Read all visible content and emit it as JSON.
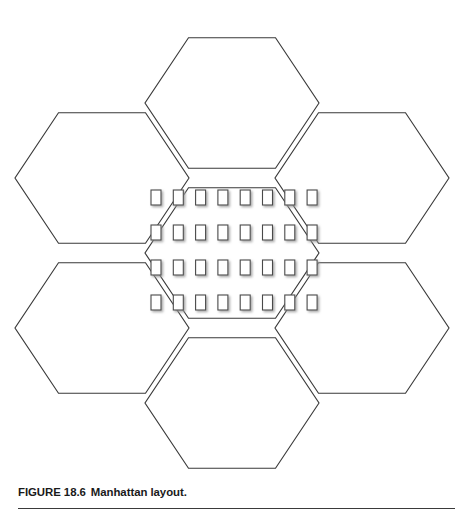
{
  "figure": {
    "caption_label": "FIGURE 18.6",
    "caption_text": "Manhattan layout.",
    "caption_full": "FIGURE 18.6  Manhattan layout.",
    "background_color": "#ffffff",
    "line_color": "#3a3a3a",
    "building_fill": "#ffffff",
    "building_stroke": "#4a4a4a",
    "building_shadow": "#bfbfbf",
    "rule_color": "#3a3a3a"
  },
  "diagram": {
    "type": "cellular-honeycomb-layout",
    "hex_cell_count": 7,
    "hex_radius": 87,
    "hex_centers": [
      {
        "name": "center-cell",
        "cx": 232,
        "cy": 253
      },
      {
        "name": "top-cell",
        "cx": 232,
        "cy": 103
      },
      {
        "name": "bottom-cell",
        "cx": 232,
        "cy": 403
      },
      {
        "name": "upper-left-cell",
        "cx": 102,
        "cy": 178
      },
      {
        "name": "upper-right-cell",
        "cx": 362,
        "cy": 178
      },
      {
        "name": "lower-left-cell",
        "cx": 102,
        "cy": 328
      },
      {
        "name": "lower-right-cell",
        "cx": 362,
        "cy": 328
      }
    ],
    "building_grid": {
      "rows": 4,
      "cols": 8,
      "building_width": 10,
      "building_height": 15,
      "col_step": 22.3,
      "row_step": 35,
      "origin_x": 151,
      "origin_y": 190
    }
  }
}
